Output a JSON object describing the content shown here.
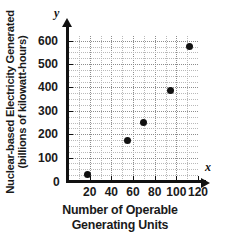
{
  "chart_data": {
    "type": "scatter",
    "title": "",
    "xlabel": "Number of Operable Generating Units",
    "xlabel_lines": [
      "Number of Operable",
      "Generating Units"
    ],
    "ylabel": "Nuclear-based Electricity Generated (billions of kilowatt-hours)",
    "ylabel_lines": [
      "Nuclear-based Electricity Generated",
      "(billions of kilowatt-hours)"
    ],
    "x_axis_name": "x",
    "y_axis_name": "y",
    "xlim": [
      0,
      120
    ],
    "ylim": [
      0,
      620
    ],
    "xticks": [
      0,
      20,
      40,
      60,
      80,
      100,
      120
    ],
    "xtick_labels": [
      "0",
      "20",
      "40",
      "60",
      "80",
      "100",
      "120"
    ],
    "yticks": [
      0,
      100,
      200,
      300,
      400,
      500,
      600
    ],
    "ytick_labels": [
      "0",
      "100",
      "200",
      "300",
      "400",
      "500",
      "600"
    ],
    "origin_label": "0",
    "grid": true,
    "grid_minor_x": 10,
    "grid_minor_y": 25,
    "legend": null,
    "marker": "filled-circle",
    "marker_color": "#111111",
    "points": [
      {
        "x": 18,
        "y": 28
      },
      {
        "x": 55,
        "y": 172
      },
      {
        "x": 70,
        "y": 250
      },
      {
        "x": 95,
        "y": 385
      },
      {
        "x": 112,
        "y": 575
      }
    ]
  },
  "colors": {
    "axis": "#111111",
    "grid": "#b9b9b9",
    "grid_major": "#8d8d8d",
    "marker": "#111111",
    "text": "#1a1a1a",
    "background": "#ffffff"
  }
}
